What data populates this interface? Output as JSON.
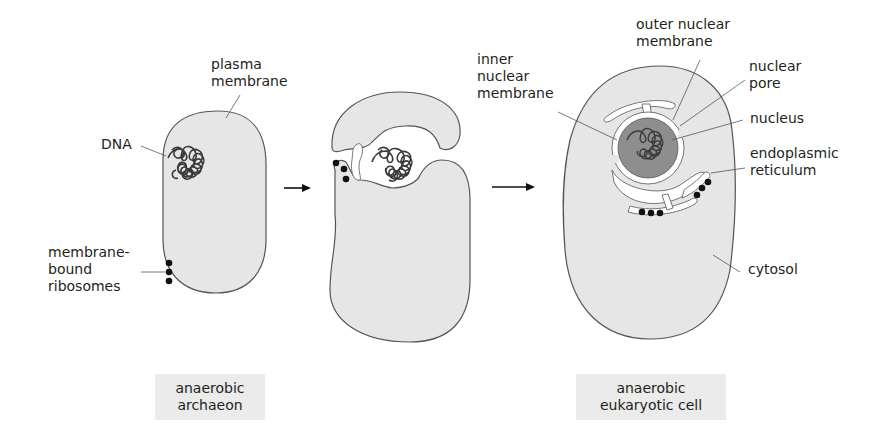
{
  "diagram": {
    "colors": {
      "cytosol": "#e6e6e6",
      "outline": "#555555",
      "nucleus": "#8e8e8e",
      "dna": "#3a3a3a",
      "ribosome": "#111111",
      "caption_bg": "#ebebeb"
    },
    "stages": [
      {
        "id": "archaeon",
        "caption_line1": "anaerobic",
        "caption_line2": "archaeon"
      },
      {
        "id": "intermediate"
      },
      {
        "id": "eukaryote",
        "caption_line1": "anaerobic",
        "caption_line2": "eukaryotic cell"
      }
    ],
    "arrows": 2,
    "labels": {
      "plasma_membrane": [
        "plasma",
        "membrane"
      ],
      "dna": "DNA",
      "membrane_bound_ribosomes": [
        "membrane-",
        "bound",
        "ribosomes"
      ],
      "inner_nuclear_membrane": [
        "inner",
        "nuclear",
        "membrane"
      ],
      "outer_nuclear_membrane": [
        "outer nuclear",
        "membrane"
      ],
      "nuclear_pore": [
        "nuclear",
        "pore"
      ],
      "nucleus": "nucleus",
      "endoplasmic_reticulum": [
        "endoplasmic",
        "reticulum"
      ],
      "cytosol": "cytosol"
    }
  }
}
